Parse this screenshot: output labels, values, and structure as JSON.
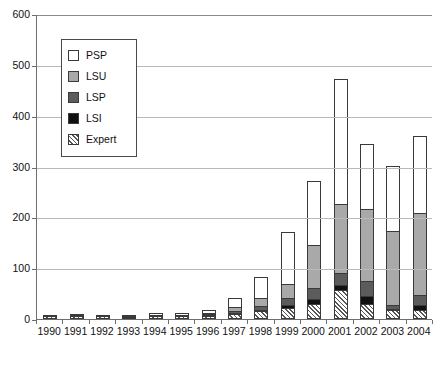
{
  "chart_data": {
    "type": "bar",
    "subtype": "stacked-vertical",
    "title": "",
    "subtitle": "",
    "xlabel": "",
    "ylabel": "",
    "categories": [
      "1990",
      "1991",
      "1992",
      "1993",
      "1994",
      "1995",
      "1996",
      "1997",
      "1998",
      "1999",
      "2000",
      "2001",
      "2002",
      "2003",
      "2004"
    ],
    "ylim": [
      0,
      600
    ],
    "yticks": [
      0,
      100,
      200,
      300,
      400,
      500,
      600
    ],
    "ytick_labels": [
      "0",
      "100",
      "200",
      "300",
      "400",
      "500",
      "600"
    ],
    "grid": true,
    "grid_axis": "y",
    "legend_position": "upper-left-inside",
    "stack_order_bottom_to_top": [
      "Expert",
      "LSI",
      "LSP",
      "LSU",
      "PSP"
    ],
    "series": [
      {
        "name": "Expert",
        "color": "#ffffff",
        "pattern": "diagonal-hatch",
        "values": [
          5,
          6,
          5,
          4,
          5,
          5,
          6,
          10,
          15,
          22,
          30,
          57,
          30,
          18,
          17
        ]
      },
      {
        "name": "LSI",
        "color": "#111111",
        "pattern": "solid",
        "values": [
          2,
          2,
          2,
          2,
          2,
          2,
          3,
          3,
          5,
          8,
          12,
          12,
          18,
          4,
          12
        ]
      },
      {
        "name": "LSP",
        "color": "#5c5c5c",
        "pattern": "solid",
        "values": [
          2,
          2,
          2,
          2,
          3,
          3,
          4,
          6,
          10,
          15,
          22,
          26,
          30,
          10,
          22
        ]
      },
      {
        "name": "LSU",
        "color": "#a9a9a9",
        "pattern": "solid",
        "values": [
          2,
          2,
          2,
          2,
          3,
          3,
          5,
          11,
          18,
          30,
          88,
          137,
          144,
          148,
          163
        ]
      },
      {
        "name": "PSP",
        "color": "#ffffff",
        "pattern": "solid",
        "values": [
          4,
          4,
          4,
          5,
          7,
          7,
          7,
          20,
          42,
          105,
          128,
          248,
          130,
          128,
          154
        ]
      }
    ],
    "totals": [
      15,
      16,
      15,
      15,
      20,
      20,
      25,
      50,
      90,
      180,
      280,
      480,
      352,
      308,
      368
    ]
  },
  "legend": {
    "items": [
      {
        "label": "PSP",
        "swatch": "white-square-icon"
      },
      {
        "label": "LSU",
        "swatch": "light-gray-square-icon"
      },
      {
        "label": "LSP",
        "swatch": "dark-gray-square-icon"
      },
      {
        "label": "LSI",
        "swatch": "black-square-icon"
      },
      {
        "label": "Expert",
        "swatch": "hatched-square-icon"
      }
    ]
  }
}
